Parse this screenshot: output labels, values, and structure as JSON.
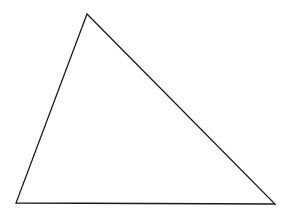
{
  "diagram": {
    "shape": "triangle",
    "stroke_color": "#1a1a1a",
    "fill_color": "none",
    "stroke_width": 1.3,
    "vertices": [
      {
        "name": "top",
        "x": 87,
        "y": 14
      },
      {
        "name": "bottom-left",
        "x": 16,
        "y": 203
      },
      {
        "name": "bottom-right",
        "x": 275,
        "y": 204
      }
    ]
  }
}
